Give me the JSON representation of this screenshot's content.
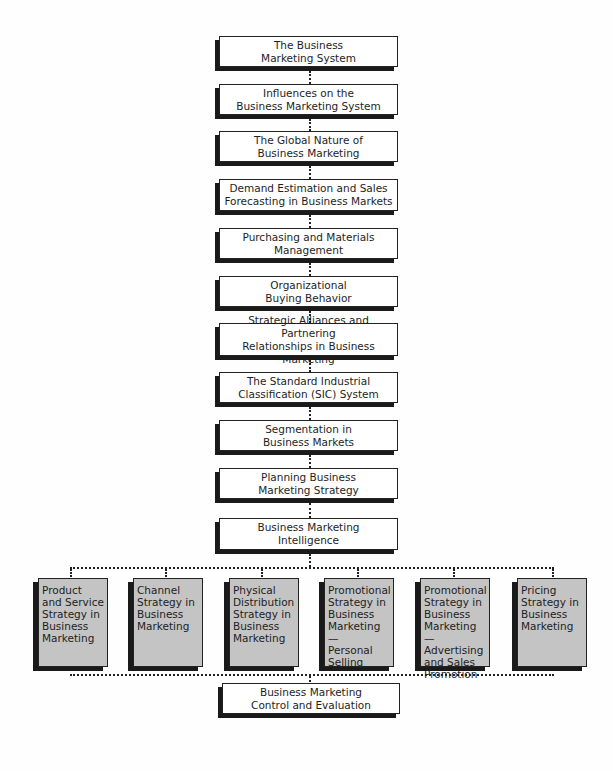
{
  "diagram": {
    "type": "flowchart",
    "main_column": [
      {
        "label": "The Business\nMarketing System"
      },
      {
        "label": "Influences on the\nBusiness Marketing System"
      },
      {
        "label": "The Global Nature of\nBusiness Marketing"
      },
      {
        "label": "Demand Estimation and Sales\nForecasting in Business Markets"
      },
      {
        "label": "Purchasing and Materials\nManagement"
      },
      {
        "label": "Organizational\nBuying Behavior"
      },
      {
        "label": "Strategic Alliances and Partnering\nRelationships in Business Marketing"
      },
      {
        "label": "The Standard Industrial\nClassification (SIC) System"
      },
      {
        "label": "Segmentation in\nBusiness Markets"
      },
      {
        "label": "Planning Business\nMarketing Strategy"
      },
      {
        "label": "Business Marketing\nIntelligence"
      }
    ],
    "strategy_row": [
      {
        "label": "Product\nand Service\nStrategy in\nBusiness\nMarketing"
      },
      {
        "label": "Channel\nStrategy in\nBusiness\nMarketing"
      },
      {
        "label": "Physical\nDistribution\nStrategy in\nBusiness\nMarketing"
      },
      {
        "label": "Promotional\nStrategy in\nBusiness\nMarketing —\nPersonal\nSelling"
      },
      {
        "label": "Promotional\nStrategy in\nBusiness\nMarketing —\nAdvertising\nand Sales\nPromotion"
      },
      {
        "label": "Pricing\nStrategy in\nBusiness\nMarketing"
      }
    ],
    "final_box": {
      "label": "Business Marketing\nControl and Evaluation"
    },
    "colors": {
      "box_fill": "#ffffff",
      "strategy_fill": "#c4c4c4",
      "shadow": "#1a1a1a",
      "connector": "#222222"
    }
  }
}
